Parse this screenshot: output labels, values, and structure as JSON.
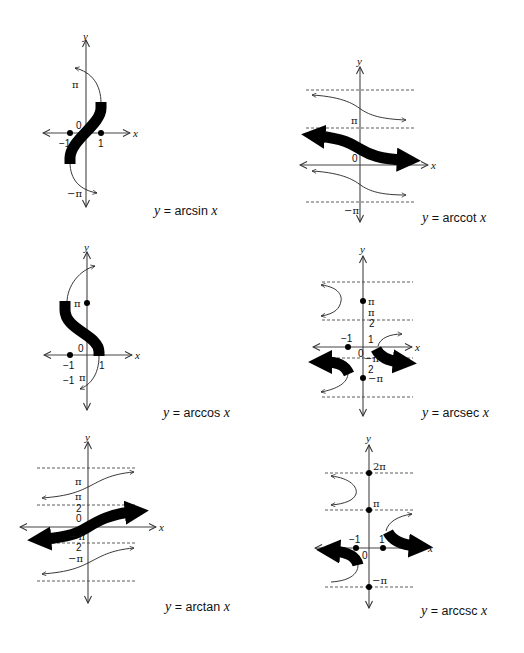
{
  "figure": {
    "panels": [
      {
        "id": "arcsin",
        "caption": {
          "y": "y",
          "eq": "=",
          "fn": "arcsin",
          "x": "x"
        },
        "labels": {
          "pi": "π",
          "neg_pi": "−π",
          "zero": "0",
          "neg_one": "−1",
          "one": "1",
          "xaxis": "x",
          "yaxis": "y"
        }
      },
      {
        "id": "arccot",
        "caption": {
          "y": "y",
          "eq": "=",
          "fn": "arccot",
          "x": "x"
        },
        "labels": {
          "pi": "π",
          "neg_pi": "−π",
          "zero": "0",
          "xaxis": "x",
          "yaxis": "y"
        }
      },
      {
        "id": "arccos",
        "caption": {
          "y": "y",
          "eq": "=",
          "fn": "arccos",
          "x": "x"
        },
        "labels": {
          "pi": "π",
          "zero": "0",
          "neg_one": "−1",
          "one": "1",
          "neg_one_pi_a": "−1",
          "neg_one_pi_b": "π",
          "xaxis": "x",
          "yaxis": "y"
        }
      },
      {
        "id": "arcsec",
        "caption": {
          "y": "y",
          "eq": "=",
          "fn": "arcsec",
          "x": "x"
        },
        "labels": {
          "pi": "π",
          "half_pi_num": "π",
          "half_pi_den": "2",
          "neg_half_pi_num": "−π",
          "neg_half_pi_den": "2",
          "neg_pi": "−π",
          "zero": "0",
          "neg_one": "−1",
          "one": "1",
          "xaxis": "x",
          "yaxis": "y"
        }
      },
      {
        "id": "arctan",
        "caption": {
          "y": "y",
          "eq": "=",
          "fn": "arctan",
          "x": "x"
        },
        "labels": {
          "pi": "π",
          "half_pi_num": "π",
          "half_pi_den": "2",
          "zero": "0",
          "neg_half_pi_num": "−π",
          "neg_half_pi_den": "2",
          "neg_pi": "−π",
          "xaxis": "x",
          "yaxis": "y"
        }
      },
      {
        "id": "arccsc",
        "caption": {
          "y": "y",
          "eq": "=",
          "fn": "arccsc",
          "x": "x"
        },
        "labels": {
          "two_pi": "2π",
          "pi": "π",
          "neg_pi": "−π",
          "zero": "0",
          "neg_one": "−1",
          "one": "1",
          "xaxis": "x",
          "yaxis": "y"
        }
      }
    ]
  }
}
